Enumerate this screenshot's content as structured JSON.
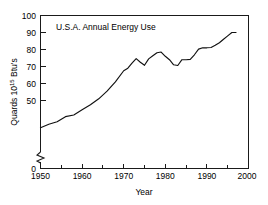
{
  "chart_data": {
    "type": "line",
    "title": "U.S.A.  Annual Energy Use",
    "title_text": "U.S.A.   Annual Energy Use",
    "xlabel": "Year",
    "ylabel_main": "Quards 10",
    "ylabel_exp": "15",
    "ylabel_tail": " Btu's",
    "ylabel_full": "Quards 10^15 Btu's",
    "xlim": [
      1950,
      2000
    ],
    "ylim": [
      0,
      100
    ],
    "y_axis_break": true,
    "y_break_between": [
      0,
      40
    ],
    "grid": false,
    "legend": null,
    "x_major_ticks": [
      1950,
      1960,
      1970,
      1980,
      1990,
      2000
    ],
    "x_major_tick_labels": [
      "1950",
      "1960",
      "1970",
      "1980",
      "1990",
      "2000"
    ],
    "x_minor_ticks": [
      1955,
      1965,
      1975,
      1985,
      1995
    ],
    "y_major_ticks": [
      0,
      50,
      60,
      70,
      80,
      90,
      100
    ],
    "y_major_tick_labels": [
      "0",
      "50",
      "60",
      "70",
      "80",
      "90",
      "100"
    ],
    "line_color": "#111111",
    "x": [
      1950,
      1952,
      1954,
      1956,
      1958,
      1960,
      1962,
      1964,
      1966,
      1968,
      1970,
      1971,
      1972,
      1973,
      1974,
      1975,
      1976,
      1977,
      1978,
      1979,
      1980,
      1981,
      1982,
      1983,
      1984,
      1985,
      1986,
      1987,
      1988,
      1989,
      1990,
      1991,
      1992,
      1993,
      1994,
      1995,
      1996,
      1997
    ],
    "values": [
      34.0,
      36.0,
      37.5,
      40.5,
      41.5,
      44.5,
      47.5,
      51.0,
      55.5,
      61.0,
      67.5,
      69.0,
      72.0,
      74.6,
      72.5,
      70.7,
      74.5,
      76.3,
      78.1,
      78.5,
      76.0,
      74.0,
      71.0,
      70.6,
      74.0,
      74.0,
      74.2,
      76.9,
      80.2,
      81.0,
      81.0,
      81.2,
      82.5,
      84.0,
      86.0,
      88.0,
      90.0,
      90.0
    ],
    "endpoint_value": 90.0,
    "peak_1973": 74.6,
    "peak_1979": 78.5,
    "trough_1975": 70.7,
    "trough_1983": 70.6,
    "start_value": 34.0
  }
}
